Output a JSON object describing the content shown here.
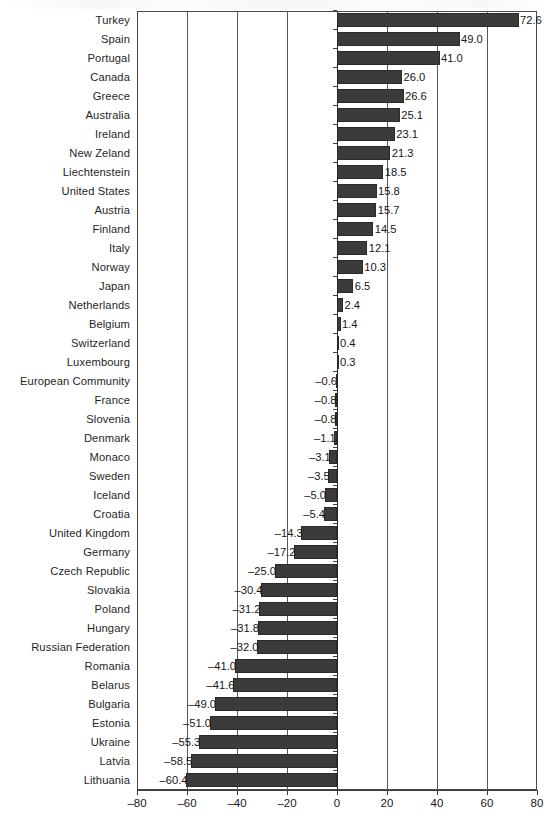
{
  "chart_data": {
    "type": "bar",
    "orientation": "horizontal",
    "title": "",
    "xlabel": "",
    "ylabel": "",
    "xlim": [
      -80,
      80
    ],
    "xticks": [
      -80,
      -60,
      -40,
      -20,
      0,
      20,
      40,
      60,
      80
    ],
    "xtick_labels": [
      "–80",
      "–60",
      "–40",
      "–20",
      "0",
      "20",
      "40",
      "60",
      "80"
    ],
    "grid": true,
    "legend": "none",
    "bar_color": "#3b3b3b",
    "categories": [
      "Turkey",
      "Spain",
      "Portugal",
      "Canada",
      "Greece",
      "Australia",
      "Ireland",
      "New Zeland",
      "Liechtenstein",
      "United States",
      "Austria",
      "Finland",
      "Italy",
      "Norway",
      "Japan",
      "Netherlands",
      "Belgium",
      "Switzerland",
      "Luxembourg",
      "European Community",
      "France",
      "Slovenia",
      "Denmark",
      "Monaco",
      "Sweden",
      "Iceland",
      "Croatia",
      "United Kingdom",
      "Germany",
      "Czech Republic",
      "Slovakia",
      "Poland",
      "Hungary",
      "Russian Federation",
      "Romania",
      "Belarus",
      "Bulgaria",
      "Estonia",
      "Ukraine",
      "Latvia",
      "Lithuania"
    ],
    "values": [
      72.6,
      49.0,
      41.0,
      26.0,
      26.6,
      25.1,
      23.1,
      21.3,
      18.5,
      15.8,
      15.7,
      14.5,
      12.1,
      10.3,
      6.5,
      2.4,
      1.4,
      0.4,
      0.3,
      -0.6,
      -0.8,
      -0.8,
      -1.1,
      -3.1,
      -3.5,
      -5.0,
      -5.4,
      -14.3,
      -17.2,
      -25.0,
      -30.4,
      -31.2,
      -31.8,
      -32.0,
      -41.0,
      -41.6,
      -49.0,
      -51.0,
      -55.3,
      -58.5,
      -60.4
    ],
    "value_labels": [
      "72.6",
      "49.0",
      "41.0",
      "26.0",
      "26.6",
      "25.1",
      "23.1",
      "21.3",
      "18.5",
      "15.8",
      "15.7",
      "14.5",
      "12.1",
      "10.3",
      "6.5",
      "2.4",
      "1.4",
      "0.4",
      "0.3",
      "–0.6",
      "–0.8",
      "–0.8",
      "–1.1",
      "–3.1",
      "–3.5",
      "–5.0",
      "–5.4",
      "–14.3",
      "–17.2",
      "–25.0",
      "–30.4",
      "–31.2",
      "–31.8",
      "–32.0",
      "–41.0",
      "–41.6",
      "–49.0",
      "–51.0",
      "–55.3",
      "–58.5",
      "–60.4"
    ]
  }
}
